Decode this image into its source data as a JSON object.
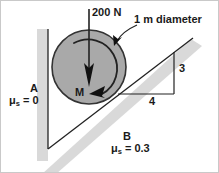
{
  "figure": {
    "width": 219,
    "height": 173
  },
  "labels": {
    "applied_force": "200 N",
    "diameter": "1 m diameter",
    "surface_a": "A",
    "surface_a_friction_symbol": "μ",
    "surface_a_friction_subscript": "s",
    "surface_a_friction_value": "= 0",
    "surface_b": "B",
    "surface_b_friction_symbol": "μ",
    "surface_b_friction_subscript": "s",
    "surface_b_friction_value": "= 0.3",
    "moment": "M",
    "slope_rise": "3",
    "slope_run": "4"
  },
  "colors": {
    "background": "#ffffff",
    "border": "#c9c9c9",
    "cylinder_fill": "#a9a9a9",
    "cylinder_stroke": "#333333",
    "support_band": "#d9d9d9",
    "outline": "#222222",
    "text": "#1a1a1a"
  },
  "geometry": {
    "cylinder_center_x": 88,
    "cylinder_center_y": 66,
    "cylinder_radius": 37,
    "wall_x": 47,
    "incline_rise": 3,
    "incline_run": 4
  }
}
